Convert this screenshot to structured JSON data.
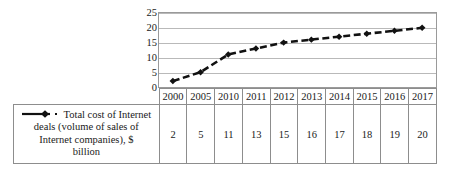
{
  "chart_data": {
    "type": "line",
    "title": "",
    "xlabel": "",
    "ylabel": "",
    "categories": [
      "2000",
      "2005",
      "2010",
      "2011",
      "2012",
      "2013",
      "2014",
      "2015",
      "2016",
      "2017"
    ],
    "series": [
      {
        "name": "Total cost of Internet deals (volume of sales of Internet companies), $ billion",
        "values": [
          2,
          5,
          11,
          13,
          15,
          16,
          17,
          18,
          19,
          20
        ],
        "marker": "diamond",
        "line_style": "dashed",
        "color": "#111111"
      }
    ],
    "ylim": [
      0,
      25
    ],
    "yticks": [
      "0",
      "5",
      "10",
      "15",
      "20",
      "25"
    ],
    "grid": true,
    "legend_position": "bottom-left-table",
    "data_table": {
      "row_label": "Total cost of Internet deals (volume of sales of Internet companies), $ billion",
      "columns": [
        "2000",
        "2005",
        "2010",
        "2011",
        "2012",
        "2013",
        "2014",
        "2015",
        "2016",
        "2017"
      ],
      "values": [
        "2",
        "5",
        "11",
        "13",
        "15",
        "16",
        "17",
        "18",
        "19",
        "20"
      ]
    }
  },
  "legend": {
    "label": "Total cost of Internet deals (volume of sales of Internet companies), $ billion",
    "line_1": "Total cost of Internet",
    "line_2": "deals (volume of sales of",
    "line_3": "Internet companies), $",
    "line_4": "billion",
    "marker_icon": "line-with-diamond-marker-icon",
    "separator_icon": "dot-icon"
  },
  "colors": {
    "series": "#111111",
    "gridline": "#b9b9b9",
    "plot_border": "#9a9a9a",
    "table_border": "#8d8d8d",
    "background": "#ffffff",
    "text": "#1a1a1a"
  }
}
